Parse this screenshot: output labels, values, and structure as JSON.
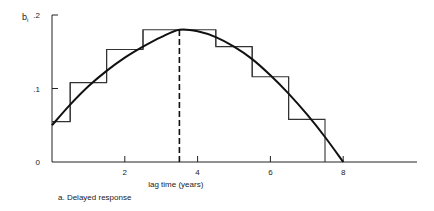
{
  "chart_data": {
    "type": "line",
    "title": "",
    "caption": "a. Delayed response",
    "xlabel": "lag time (years)",
    "ylabel": "b_i",
    "ylabel_main": "b",
    "ylabel_sub": "i",
    "xlim": [
      0,
      10.2
    ],
    "ylim": [
      0,
      0.2
    ],
    "x_ticks": [
      2,
      4,
      6,
      8
    ],
    "x_tick_labels": [
      "2",
      "4",
      "6",
      "8"
    ],
    "y_ticks": [
      0,
      0.1,
      0.2
    ],
    "y_tick_labels": [
      "0",
      ".1",
      ".2"
    ],
    "grid": false,
    "legend": null,
    "series": [
      {
        "name": "smooth lag distribution (polynomial)",
        "style": "solid-curve",
        "x": [
          0,
          0.5,
          1,
          1.5,
          2,
          2.5,
          3,
          3.5,
          4,
          4.5,
          5,
          5.5,
          6,
          6.5,
          7,
          7.5,
          8
        ],
        "values": [
          0.05,
          0.078,
          0.103,
          0.124,
          0.142,
          0.157,
          0.17,
          0.18,
          0.178,
          0.17,
          0.157,
          0.14,
          0.118,
          0.093,
          0.065,
          0.034,
          0.0
        ]
      },
      {
        "name": "discrete lag weights (step)",
        "style": "step",
        "x_edges": [
          0,
          0.5,
          1.5,
          2.5,
          3.5,
          4.5,
          5.5,
          6.5,
          7.5
        ],
        "values": [
          0.055,
          0.108,
          0.153,
          0.18,
          0.18,
          0.157,
          0.116,
          0.058
        ]
      }
    ],
    "annotations": [
      {
        "type": "dashed-vertical-line",
        "x": 3.5,
        "y_top": 0.182,
        "label": "peak of lag distribution"
      }
    ]
  }
}
